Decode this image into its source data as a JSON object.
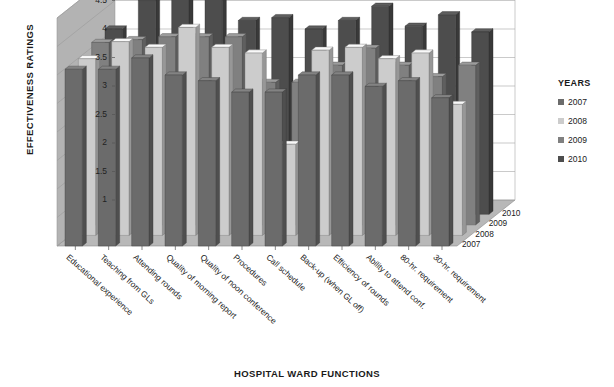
{
  "chart_data": {
    "type": "bar",
    "title": "",
    "xlabel": "HOSPITAL WARD FUNCTIONS",
    "ylabel": "EFFECTIVENESS RATINGS",
    "ylim": [
      1,
      5
    ],
    "yticks": [
      "1",
      "1.5",
      "2",
      "2.5",
      "3",
      "3.5",
      "4",
      "4.5",
      "5"
    ],
    "ytick_values": [
      1,
      1.5,
      2,
      2.5,
      3,
      3.5,
      4,
      4.5,
      5
    ],
    "grid": true,
    "legend_title": "YEARS",
    "legend_position": "right",
    "projection": "3d-grouped-columns",
    "depth_axis_labels": [
      "2007",
      "2008",
      "2009",
      "2010"
    ],
    "categories": [
      "Educational experience",
      "Teaching from GLs",
      "Attending rounds",
      "Quality of morning report",
      "Quality of noon conference",
      "Procedures",
      "Call schedule",
      "Back-up (when GL off)",
      "Efficiency of rounds",
      "Ability to attend conf.",
      "80-hr. requirement",
      "30-hr. requirement"
    ],
    "series": [
      {
        "name": "2007",
        "color": "#6b6b6b",
        "values": [
          4.1,
          4.1,
          4.3,
          4.0,
          3.9,
          3.7,
          3.7,
          4.0,
          4.0,
          3.8,
          3.9,
          3.6
        ]
      },
      {
        "name": "2008",
        "color": "#cccccc",
        "values": [
          4.1,
          4.4,
          4.3,
          4.65,
          4.3,
          4.2,
          2.6,
          4.25,
          4.3,
          4.1,
          4.2,
          3.3
        ]
      },
      {
        "name": "2009",
        "color": "#808080",
        "values": [
          4.2,
          4.25,
          4.3,
          4.3,
          4.3,
          3.5,
          3.5,
          3.8,
          4.1,
          3.8,
          3.6,
          3.8
        ]
      },
      {
        "name": "2010",
        "color": "#4d4d4d",
        "values": [
          4.25,
          4.75,
          4.9,
          4.9,
          4.4,
          4.45,
          4.25,
          4.4,
          4.65,
          4.3,
          4.5,
          4.2
        ]
      }
    ]
  },
  "legend": {
    "title": "YEARS",
    "items": [
      {
        "label": "2007",
        "color": "#6b6b6b"
      },
      {
        "label": "2008",
        "color": "#cccccc"
      },
      {
        "label": "2009",
        "color": "#808080"
      },
      {
        "label": "2010",
        "color": "#4d4d4d"
      }
    ]
  },
  "axes": {
    "y_title": "EFFECTIVENESS RATINGS",
    "x_title": "HOSPITAL WARD FUNCTIONS"
  },
  "colors": {
    "wall_back": "#ffffff",
    "wall_side": "#b3b3b3",
    "floor": "#b8b8b8",
    "gridline": "#a6a6a6",
    "text": "#1a1a1a"
  }
}
